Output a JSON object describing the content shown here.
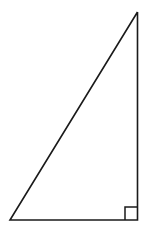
{
  "figure": {
    "kind": "geometry-diagram",
    "canvas": {
      "width": 153,
      "height": 238,
      "background": "#ffffff"
    },
    "stroke": {
      "color": "#1a1a1a",
      "width": 1.6
    },
    "vertices": [
      {
        "name": "apex",
        "x": 137.5,
        "y": 12
      },
      {
        "name": "bottom-left",
        "x": 10,
        "y": 220
      },
      {
        "name": "right-angle-vertex",
        "x": 137.5,
        "y": 220
      }
    ],
    "outline_points": "137.5,12 10,220 137.5,220 137.5,12",
    "right_angle_marker": {
      "at_vertex": "right-angle-vertex",
      "size": 13,
      "points": "125,220 125,207 137.5,207"
    },
    "labels": []
  }
}
